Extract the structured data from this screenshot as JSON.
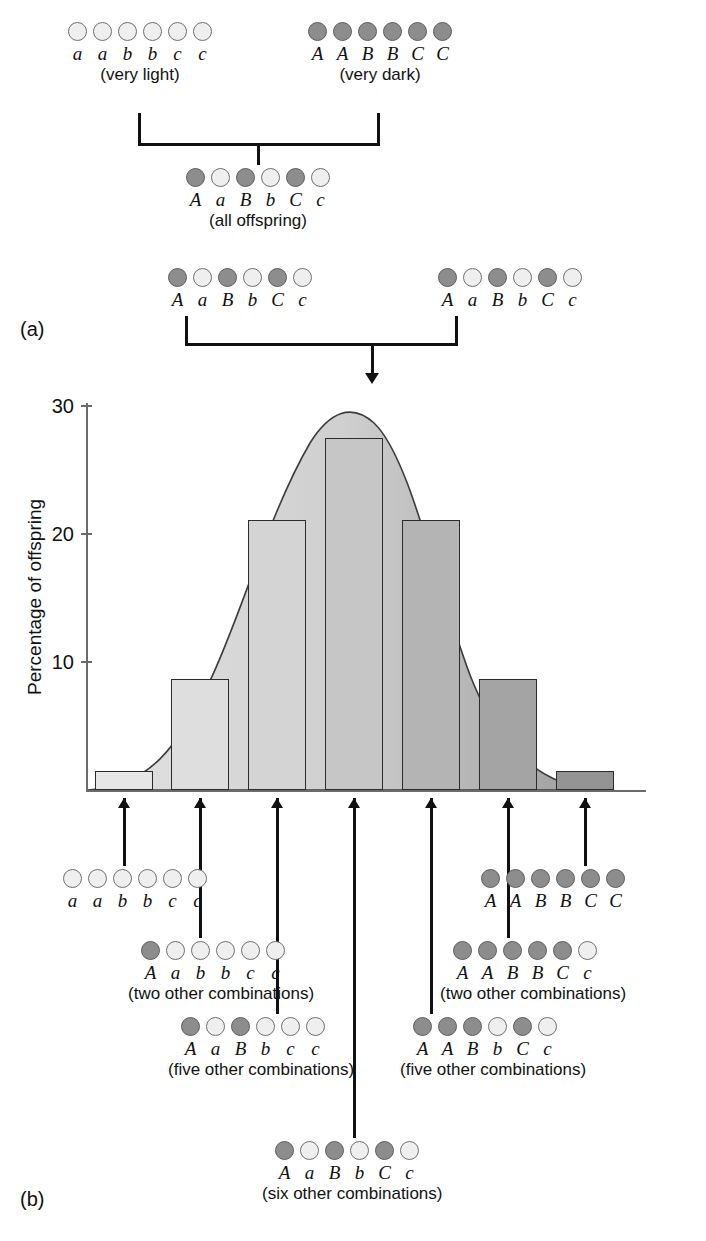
{
  "figure": {
    "panel_a_label": "(a)",
    "panel_b_label": "(b)"
  },
  "panel_a": {
    "parents": [
      {
        "name": "parent-very-light",
        "alleles": [
          "a",
          "a",
          "b",
          "b",
          "c",
          "c"
        ],
        "shades": [
          "light",
          "light",
          "light",
          "light",
          "light",
          "light"
        ],
        "caption": "(very light)"
      },
      {
        "name": "parent-very-dark",
        "alleles": [
          "A",
          "A",
          "B",
          "B",
          "C",
          "C"
        ],
        "shades": [
          "dark",
          "dark",
          "dark",
          "dark",
          "dark",
          "dark"
        ],
        "caption": "(very dark)"
      }
    ],
    "f1": {
      "alleles": [
        "A",
        "a",
        "B",
        "b",
        "C",
        "c"
      ],
      "shades": [
        "dark",
        "light",
        "dark",
        "light",
        "dark",
        "light"
      ],
      "caption": "(all offspring)"
    },
    "f1_cross": [
      {
        "name": "f1-parent-left",
        "alleles": [
          "A",
          "a",
          "B",
          "b",
          "C",
          "c"
        ],
        "shades": [
          "dark",
          "light",
          "dark",
          "light",
          "dark",
          "light"
        ],
        "caption": ""
      },
      {
        "name": "f1-parent-right",
        "alleles": [
          "A",
          "a",
          "B",
          "b",
          "C",
          "c"
        ],
        "shades": [
          "dark",
          "light",
          "dark",
          "light",
          "dark",
          "light"
        ],
        "caption": ""
      }
    ]
  },
  "chart_data": {
    "type": "bar",
    "title": "",
    "xlabel": "",
    "ylabel": "Percentage of offspring",
    "ylim": [
      0,
      33
    ],
    "yticks": [
      10,
      20,
      30
    ],
    "ytick_labels": [
      "10",
      "20",
      "30"
    ],
    "grid": false,
    "legend": null,
    "categories": [
      "0 dark alleles",
      "1 dark allele",
      "2 dark alleles",
      "3 dark alleles",
      "4 dark alleles",
      "5 dark alleles",
      "6 dark alleles"
    ],
    "values": [
      1.6,
      9.5,
      23,
      30,
      23,
      9.5,
      1.6
    ],
    "genotype_labels": [
      "a a b b c c",
      "A a b b c c",
      "A a B b c c",
      "A a B b C c",
      "A A B b C c",
      "A A B B C c",
      "A A B B C C"
    ],
    "overlay_curve": "normal distribution bell curve",
    "bar_shading": "light gray on the left grading to darker gray on the right"
  },
  "panel_b": {
    "genotypes": [
      {
        "name": "genotype-aabbcc",
        "alleles": [
          "a",
          "a",
          "b",
          "b",
          "c",
          "c"
        ],
        "shades": [
          "light",
          "light",
          "light",
          "light",
          "light",
          "light"
        ],
        "caption": ""
      },
      {
        "name": "genotype-Aabbcc",
        "alleles": [
          "A",
          "a",
          "b",
          "b",
          "c",
          "c"
        ],
        "shades": [
          "dark",
          "light",
          "light",
          "light",
          "light",
          "light"
        ],
        "caption": "(two other combinations)"
      },
      {
        "name": "genotype-AaBbcc",
        "alleles": [
          "A",
          "a",
          "B",
          "b",
          "c",
          "c"
        ],
        "shades": [
          "dark",
          "light",
          "dark",
          "light",
          "light",
          "light"
        ],
        "caption": "(five other combinations)"
      },
      {
        "name": "genotype-AaBbCc",
        "alleles": [
          "A",
          "a",
          "B",
          "b",
          "C",
          "c"
        ],
        "shades": [
          "dark",
          "light",
          "dark",
          "light",
          "dark",
          "light"
        ],
        "caption": "(six other combinations)"
      },
      {
        "name": "genotype-AABbCc",
        "alleles": [
          "A",
          "A",
          "B",
          "b",
          "C",
          "c"
        ],
        "shades": [
          "dark",
          "dark",
          "dark",
          "light",
          "dark",
          "light"
        ],
        "caption": "(five other combinations)"
      },
      {
        "name": "genotype-AABBCc",
        "alleles": [
          "A",
          "A",
          "B",
          "B",
          "C",
          "c"
        ],
        "shades": [
          "dark",
          "dark",
          "dark",
          "dark",
          "dark",
          "light"
        ],
        "caption": "(two other combinations)"
      },
      {
        "name": "genotype-AABBCC",
        "alleles": [
          "A",
          "A",
          "B",
          "B",
          "C",
          "C"
        ],
        "shades": [
          "dark",
          "dark",
          "dark",
          "dark",
          "dark",
          "dark"
        ],
        "caption": ""
      }
    ]
  },
  "colors": {
    "dot_light": "#efefef",
    "dot_dark": "#8d8d8d",
    "line": "#111111",
    "axis": "#6b6b6b",
    "curve_fill_light": "#dcdcdc",
    "curve_fill_dark": "#9a9a9a"
  }
}
